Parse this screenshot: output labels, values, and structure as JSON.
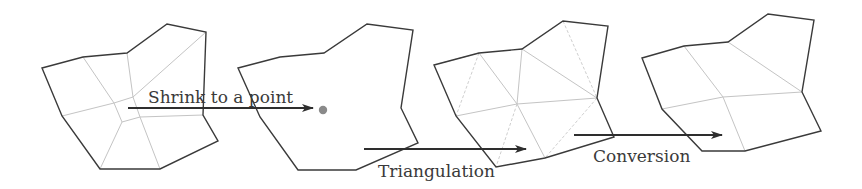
{
  "diagram": {
    "type": "process",
    "steps": [
      {
        "id": "input-quad-mesh",
        "description": "Polygon partitioned into quadrilaterals"
      },
      {
        "id": "empty-polygon",
        "description": "Polygon with interior shrunk to a single point"
      },
      {
        "id": "triangulated-polygon",
        "description": "Polygon triangulated from the central point"
      },
      {
        "id": "converted-quad-mesh",
        "description": "Polygon converted back into quadrilaterals"
      }
    ],
    "arrows": [
      {
        "from": "input-quad-mesh",
        "to": "empty-polygon",
        "label": "Shrink to a point"
      },
      {
        "from": "empty-polygon",
        "to": "triangulated-polygon",
        "label": "Triangulation"
      },
      {
        "from": "triangulated-polygon",
        "to": "converted-quad-mesh",
        "label": "Conversion"
      }
    ]
  },
  "labels": {
    "shrink": "Shrink to a point",
    "triangulation": "Triangulation",
    "conversion": "Conversion"
  },
  "colors": {
    "outline": "#3a3a3a",
    "inner_edge": "#c4c4c4",
    "point": "#8a8a8a",
    "arrow": "#2e2e2e"
  }
}
